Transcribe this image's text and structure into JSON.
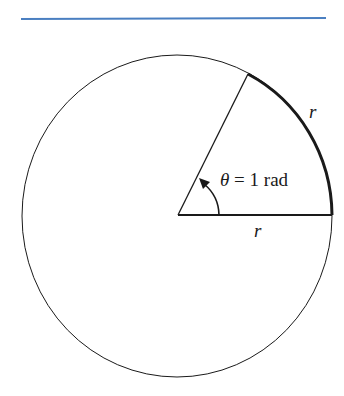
{
  "colors": {
    "rule": "#4a7fc1",
    "ink": "#1a1a1a",
    "background": "#ffffff"
  },
  "diagram": {
    "angle_label": {
      "symbol": "θ",
      "equals": "=",
      "value": "1 rad"
    },
    "arc_label": "r",
    "radius_label": "r"
  }
}
